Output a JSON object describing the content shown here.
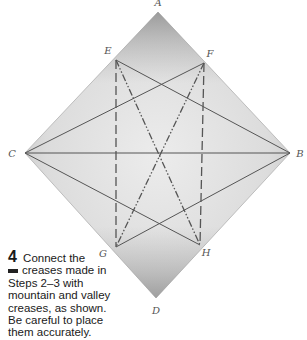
{
  "diagram": {
    "points": {
      "A": {
        "label": "A"
      },
      "B": {
        "label": "B"
      },
      "C": {
        "label": "C"
      },
      "D": {
        "label": "D"
      },
      "E": {
        "label": "E"
      },
      "F": {
        "label": "F"
      },
      "G": {
        "label": "G"
      },
      "H": {
        "label": "H"
      }
    },
    "creases": [
      {
        "from": "C",
        "to": "B",
        "type": "existing"
      },
      {
        "from": "E",
        "to": "B",
        "type": "existing"
      },
      {
        "from": "F",
        "to": "C",
        "type": "existing"
      },
      {
        "from": "C",
        "to": "H",
        "type": "existing"
      },
      {
        "from": "B",
        "to": "G",
        "type": "existing"
      },
      {
        "from": "E",
        "to": "G",
        "type": "valley"
      },
      {
        "from": "F",
        "to": "H",
        "type": "valley"
      },
      {
        "from": "E",
        "to": "H",
        "type": "mountain"
      },
      {
        "from": "F",
        "to": "G",
        "type": "mountain"
      }
    ],
    "colors": {
      "paper_light": "#e9e9e9",
      "paper_dark": "#9a9a9a",
      "crease": "#555555"
    }
  },
  "instruction": {
    "step_number": "4",
    "text_line1": "Connect the",
    "text_rest": "creases made in Steps 2–3 with mountain and valley creases, as shown. Be careful to place them accurately."
  }
}
